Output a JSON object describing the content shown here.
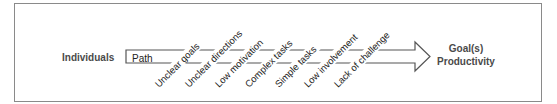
{
  "diagram": {
    "source_label": "Individuals",
    "path_label": "Path",
    "target_label_line1": "Goal(s)",
    "target_label_line2": "Productivity",
    "obstacles": [
      "Unclear goals",
      "Unclear directions",
      "Low motivation",
      "Complex tasks",
      "Simple tasks",
      "Low involvement",
      "Lack of challenge"
    ],
    "colors": {
      "frame": "#8a8a8a",
      "arrow_stroke": "#555555",
      "bold_text": "#4a4a4a",
      "text": "#222222"
    }
  }
}
